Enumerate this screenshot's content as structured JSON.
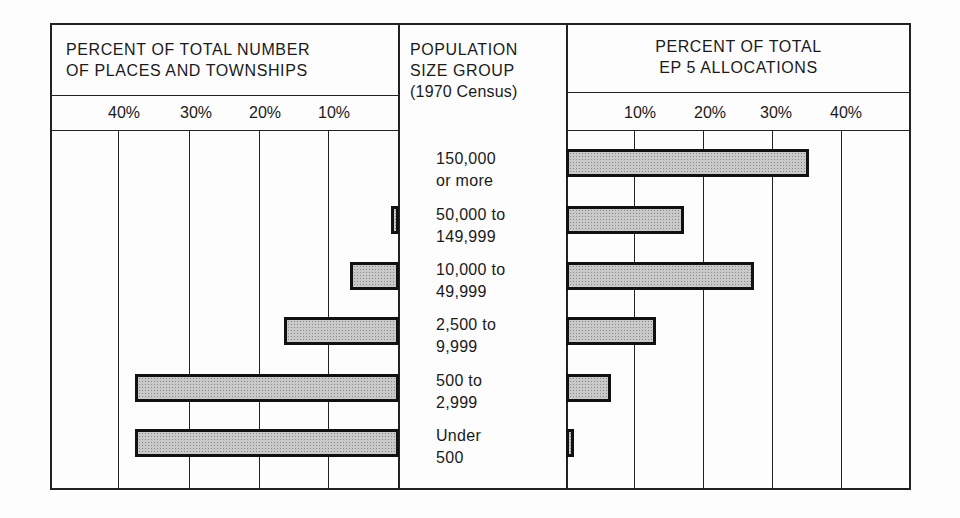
{
  "chart_data": {
    "type": "bar",
    "orientation": "horizontal",
    "layout": "butterfly",
    "title": "",
    "center_column_header": [
      "POPULATION",
      "SIZE GROUP",
      "(1970 Census)"
    ],
    "categories": [
      "150,000 or more",
      "50,000 to 149,999",
      "10,000 to 49,999",
      "2,500 to 9,999",
      "500 to 2,999",
      "Under 500"
    ],
    "category_lines": [
      [
        "150,000",
        "or more"
      ],
      [
        "50,000 to",
        "149,999"
      ],
      [
        "10,000 to",
        "49,999"
      ],
      [
        "2,500 to",
        "9,999"
      ],
      [
        "500 to",
        "2,999"
      ],
      [
        "Under",
        "500"
      ]
    ],
    "series": [
      {
        "name": "PERCENT OF TOTAL NUMBER OF PLACES AND TOWNSHIPS",
        "header_lines": [
          "PERCENT OF TOTAL NUMBER",
          "OF PLACES AND TOWNSHIPS"
        ],
        "side": "left",
        "values": [
          0,
          1,
          7,
          16.5,
          38,
          38
        ],
        "ticks": [
          "40%",
          "30%",
          "20%",
          "10%"
        ],
        "xlim": [
          50,
          0
        ]
      },
      {
        "name": "PERCENT OF TOTAL EP 5 ALLOCATIONS",
        "header_lines": [
          "PERCENT OF TOTAL",
          "EP 5 ALLOCATIONS"
        ],
        "side": "right",
        "values": [
          35,
          17,
          27,
          13,
          6.5,
          1
        ],
        "ticks": [
          "10%",
          "20%",
          "30%",
          "40%"
        ],
        "xlim": [
          0,
          50
        ]
      }
    ],
    "xlabel": "Percent",
    "ylabel": "Population size group (1970 Census)",
    "grid": true,
    "legend": "none",
    "bar_fill": "#c9c9c9",
    "bar_border": "#111111"
  }
}
